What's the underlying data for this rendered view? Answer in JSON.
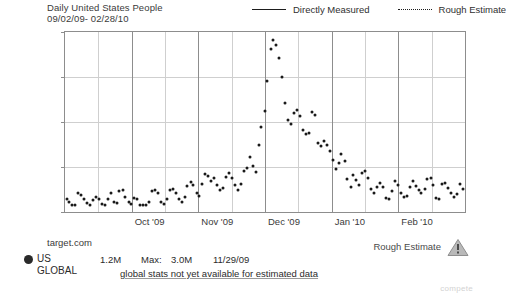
{
  "header": {
    "title": "Daily United States People",
    "date_range": "09/02/09- 02/28/10"
  },
  "legend": {
    "items": [
      {
        "label": "Directly Measured",
        "style": "solid"
      },
      {
        "label": "Rough Estimate",
        "style": "dotted"
      }
    ]
  },
  "footer": {
    "site": "target.com",
    "region_selected": "US",
    "region_other": "GLOBAL",
    "current_value": "1.2M",
    "max_label": "Max:",
    "max_value": "3.0M",
    "max_date": "11/29/09",
    "global_note": "global stats not yet available for estimated data",
    "rough_estimate_label": "Rough Estimate",
    "warning_icon": "warning-triangle-icon",
    "watermark": "compete"
  },
  "chart_data": {
    "type": "scatter",
    "title": "Daily United States People",
    "subtitle": "09/02/09- 02/28/10",
    "xlabel": "",
    "ylabel": "",
    "ylim": [
      700000,
      3100000
    ],
    "ytick_labels": [
      ".7M",
      "1.3M",
      "1.9M",
      "2.5M",
      "3.1M"
    ],
    "ytick_values": [
      700000,
      1300000,
      1900000,
      2500000,
      3100000
    ],
    "xtick_labels": [
      "Oct '09",
      "Nov '09",
      "Dec '09",
      "Jan '10",
      "Feb '10"
    ],
    "x_range": [
      "09/02/09",
      "02/28/10"
    ],
    "grid": true,
    "legend_position": "top-right",
    "series": [
      {
        "name": "Directly Measured",
        "marker": "dot",
        "color": "#1a1a1a",
        "points": [
          {
            "x": 0.004,
            "y": 870000
          },
          {
            "x": 0.011,
            "y": 840000
          },
          {
            "x": 0.018,
            "y": 800000
          },
          {
            "x": 0.026,
            "y": 790000
          },
          {
            "x": 0.033,
            "y": 960000
          },
          {
            "x": 0.04,
            "y": 930000
          },
          {
            "x": 0.048,
            "y": 880000
          },
          {
            "x": 0.055,
            "y": 820000
          },
          {
            "x": 0.063,
            "y": 800000
          },
          {
            "x": 0.07,
            "y": 860000
          },
          {
            "x": 0.077,
            "y": 900000
          },
          {
            "x": 0.085,
            "y": 880000
          },
          {
            "x": 0.092,
            "y": 805000
          },
          {
            "x": 0.1,
            "y": 790000
          },
          {
            "x": 0.107,
            "y": 880000
          },
          {
            "x": 0.114,
            "y": 960000
          },
          {
            "x": 0.122,
            "y": 830000
          },
          {
            "x": 0.129,
            "y": 820000
          },
          {
            "x": 0.136,
            "y": 980000
          },
          {
            "x": 0.144,
            "y": 990000
          },
          {
            "x": 0.151,
            "y": 900000
          },
          {
            "x": 0.159,
            "y": 830000
          },
          {
            "x": 0.166,
            "y": 810000
          },
          {
            "x": 0.173,
            "y": 890000
          },
          {
            "x": 0.181,
            "y": 870000
          },
          {
            "x": 0.188,
            "y": 800000
          },
          {
            "x": 0.196,
            "y": 800000
          },
          {
            "x": 0.203,
            "y": 790000
          },
          {
            "x": 0.21,
            "y": 840000
          },
          {
            "x": 0.218,
            "y": 980000
          },
          {
            "x": 0.225,
            "y": 990000
          },
          {
            "x": 0.233,
            "y": 950000
          },
          {
            "x": 0.24,
            "y": 840000
          },
          {
            "x": 0.247,
            "y": 810000
          },
          {
            "x": 0.255,
            "y": 870000
          },
          {
            "x": 0.262,
            "y": 1000000
          },
          {
            "x": 0.269,
            "y": 1010000
          },
          {
            "x": 0.277,
            "y": 950000
          },
          {
            "x": 0.284,
            "y": 870000
          },
          {
            "x": 0.292,
            "y": 830000
          },
          {
            "x": 0.299,
            "y": 900000
          },
          {
            "x": 0.306,
            "y": 1050000
          },
          {
            "x": 0.314,
            "y": 1100000
          },
          {
            "x": 0.321,
            "y": 1060000
          },
          {
            "x": 0.329,
            "y": 960000
          },
          {
            "x": 0.336,
            "y": 920000
          },
          {
            "x": 0.343,
            "y": 1080000
          },
          {
            "x": 0.351,
            "y": 1210000
          },
          {
            "x": 0.358,
            "y": 1180000
          },
          {
            "x": 0.366,
            "y": 1120000
          },
          {
            "x": 0.373,
            "y": 1160000
          },
          {
            "x": 0.38,
            "y": 1060000
          },
          {
            "x": 0.388,
            "y": 1000000
          },
          {
            "x": 0.395,
            "y": 1020000
          },
          {
            "x": 0.403,
            "y": 1170000
          },
          {
            "x": 0.41,
            "y": 1220000
          },
          {
            "x": 0.417,
            "y": 1150000
          },
          {
            "x": 0.425,
            "y": 1060000
          },
          {
            "x": 0.432,
            "y": 990000
          },
          {
            "x": 0.44,
            "y": 1070000
          },
          {
            "x": 0.447,
            "y": 1250000
          },
          {
            "x": 0.454,
            "y": 1290000
          },
          {
            "x": 0.462,
            "y": 1430000
          },
          {
            "x": 0.469,
            "y": 1320000
          },
          {
            "x": 0.477,
            "y": 1230000
          },
          {
            "x": 0.484,
            "y": 1600000
          },
          {
            "x": 0.491,
            "y": 1840000
          },
          {
            "x": 0.499,
            "y": 2050000
          },
          {
            "x": 0.506,
            "y": 2450000
          },
          {
            "x": 0.514,
            "y": 2880000
          },
          {
            "x": 0.521,
            "y": 3000000
          },
          {
            "x": 0.528,
            "y": 2930000
          },
          {
            "x": 0.536,
            "y": 2760000
          },
          {
            "x": 0.543,
            "y": 2500000
          },
          {
            "x": 0.551,
            "y": 2150000
          },
          {
            "x": 0.558,
            "y": 1930000
          },
          {
            "x": 0.565,
            "y": 1870000
          },
          {
            "x": 0.573,
            "y": 2020000
          },
          {
            "x": 0.58,
            "y": 2060000
          },
          {
            "x": 0.588,
            "y": 1980000
          },
          {
            "x": 0.595,
            "y": 1790000
          },
          {
            "x": 0.602,
            "y": 1740000
          },
          {
            "x": 0.61,
            "y": 1760000
          },
          {
            "x": 0.617,
            "y": 2040000
          },
          {
            "x": 0.625,
            "y": 1990000
          },
          {
            "x": 0.632,
            "y": 1620000
          },
          {
            "x": 0.639,
            "y": 1580000
          },
          {
            "x": 0.647,
            "y": 1650000
          },
          {
            "x": 0.654,
            "y": 1600000
          },
          {
            "x": 0.662,
            "y": 1520000
          },
          {
            "x": 0.669,
            "y": 1400000
          },
          {
            "x": 0.677,
            "y": 1280000
          },
          {
            "x": 0.684,
            "y": 1350000
          },
          {
            "x": 0.691,
            "y": 1470000
          },
          {
            "x": 0.699,
            "y": 1380000
          },
          {
            "x": 0.706,
            "y": 1140000
          },
          {
            "x": 0.714,
            "y": 1040000
          },
          {
            "x": 0.721,
            "y": 1200000
          },
          {
            "x": 0.728,
            "y": 1130000
          },
          {
            "x": 0.736,
            "y": 1060000
          },
          {
            "x": 0.743,
            "y": 1220000
          },
          {
            "x": 0.751,
            "y": 1250000
          },
          {
            "x": 0.758,
            "y": 1150000
          },
          {
            "x": 0.765,
            "y": 1010000
          },
          {
            "x": 0.773,
            "y": 960000
          },
          {
            "x": 0.78,
            "y": 1030000
          },
          {
            "x": 0.788,
            "y": 1090000
          },
          {
            "x": 0.795,
            "y": 1040000
          },
          {
            "x": 0.802,
            "y": 890000
          },
          {
            "x": 0.81,
            "y": 870000
          },
          {
            "x": 0.817,
            "y": 980000
          },
          {
            "x": 0.825,
            "y": 1120000
          },
          {
            "x": 0.832,
            "y": 1060000
          },
          {
            "x": 0.84,
            "y": 960000
          },
          {
            "x": 0.847,
            "y": 900000
          },
          {
            "x": 0.854,
            "y": 920000
          },
          {
            "x": 0.862,
            "y": 1040000
          },
          {
            "x": 0.869,
            "y": 1110000
          },
          {
            "x": 0.877,
            "y": 1050000
          },
          {
            "x": 0.884,
            "y": 1000000
          },
          {
            "x": 0.891,
            "y": 960000
          },
          {
            "x": 0.899,
            "y": 1010000
          },
          {
            "x": 0.906,
            "y": 1140000
          },
          {
            "x": 0.914,
            "y": 1150000
          },
          {
            "x": 0.921,
            "y": 1060000
          },
          {
            "x": 0.928,
            "y": 890000
          },
          {
            "x": 0.936,
            "y": 880000
          },
          {
            "x": 0.943,
            "y": 1080000
          },
          {
            "x": 0.951,
            "y": 1090000
          },
          {
            "x": 0.958,
            "y": 1020000
          },
          {
            "x": 0.966,
            "y": 960000
          },
          {
            "x": 0.973,
            "y": 900000
          },
          {
            "x": 0.98,
            "y": 940000
          },
          {
            "x": 0.988,
            "y": 1080000
          },
          {
            "x": 0.995,
            "y": 1010000
          }
        ]
      }
    ],
    "annotations": {
      "max_value": 3000000,
      "max_date": "11/29/09",
      "current_value": 1200000
    }
  }
}
